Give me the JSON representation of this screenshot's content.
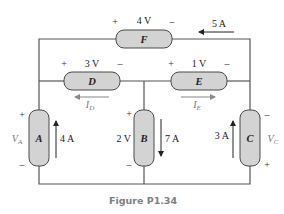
{
  "figure": {
    "caption": "Figure P1.34"
  },
  "elements": {
    "A": {
      "name": "A",
      "voltage_label": "V",
      "voltage_sub": "A",
      "current": "4 A",
      "plus": "+",
      "minus": "–"
    },
    "B": {
      "name": "B",
      "voltage": "2 V",
      "current": "7 A",
      "plus": "+",
      "minus": "–"
    },
    "C": {
      "name": "C",
      "voltage_label": "V",
      "voltage_sub": "C",
      "current": "3 A",
      "plus": "+",
      "minus": "–"
    },
    "D": {
      "name": "D",
      "voltage": "3 V",
      "current_label": "I",
      "current_sub": "D",
      "plus": "+",
      "minus": "–"
    },
    "E": {
      "name": "E",
      "voltage": "1 V",
      "current_label": "I",
      "current_sub": "E",
      "plus": "+",
      "minus": "–"
    },
    "F": {
      "name": "F",
      "voltage": "4 V",
      "current": "5 A",
      "plus": "+",
      "minus": "–"
    }
  },
  "colors": {
    "element_fill": "#d3d3d3",
    "wire": "#555555",
    "caption": "#7a8088"
  }
}
